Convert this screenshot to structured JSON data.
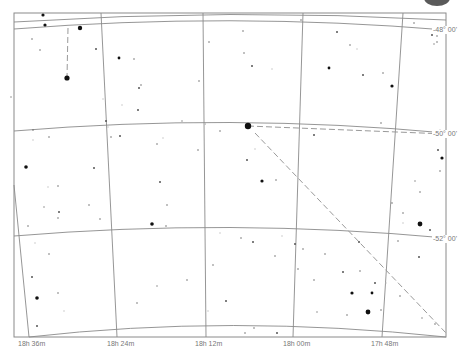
{
  "chart_type": "star-chart",
  "colors": {
    "background": "#ffffff",
    "grid": "#8a8a8a",
    "star": "#111111",
    "faint_star": "#bdbdbd",
    "dashed_line": "#9a9a9a",
    "label": "#777777",
    "corner_blob": "#5a5a5a"
  },
  "dec_labels": [
    {
      "text": "-48° 00'",
      "x": 432,
      "y": 26
    },
    {
      "text": "-50° 00'",
      "x": 432,
      "y": 130
    },
    {
      "text": "-52° 00'",
      "x": 432,
      "y": 235
    }
  ],
  "ra_labels": [
    {
      "text": "18h 36m",
      "x": 18,
      "y": 340
    },
    {
      "text": "18h 24m",
      "x": 107,
      "y": 340
    },
    {
      "text": "18h 12m",
      "x": 195,
      "y": 340
    },
    {
      "text": "18h 00m",
      "x": 283,
      "y": 340
    },
    {
      "text": "17h 48m",
      "x": 371,
      "y": 340
    }
  ],
  "frame": {
    "x1": 14,
    "y1": 13,
    "x2": 446,
    "y2": 337
  },
  "dec_lines": [
    {
      "name": "dec-top",
      "d": "M14,22 Q230,8 446,20"
    },
    {
      "name": "dec-48",
      "d": "M14,29 Q230,12 446,30"
    },
    {
      "name": "dec-50",
      "d": "M14,131 Q230,113 446,133"
    },
    {
      "name": "dec-52",
      "d": "M14,236 Q230,218 446,238"
    },
    {
      "name": "dec-bottom",
      "d": "M29,337 Q230,314 446,337"
    }
  ],
  "ra_lines": [
    {
      "name": "ra-18h36m",
      "x1": 14,
      "y1": 185,
      "x2": 29,
      "y2": 337
    },
    {
      "name": "ra-18h24m",
      "x1": 101,
      "y1": 13,
      "x2": 117,
      "y2": 337
    },
    {
      "name": "ra-18h12m",
      "x1": 203,
      "y1": 13,
      "x2": 206,
      "y2": 337
    },
    {
      "name": "ra-18h00m",
      "x1": 303,
      "y1": 13,
      "x2": 293,
      "y2": 337
    },
    {
      "name": "ra-17h48m",
      "x1": 403,
      "y1": 13,
      "x2": 382,
      "y2": 337
    }
  ],
  "dashed_lines": [
    {
      "name": "constellation-line-1",
      "x1": 68,
      "y1": 28,
      "x2": 67,
      "y2": 78
    },
    {
      "name": "constellation-line-2",
      "x1": 248,
      "y1": 126,
      "x2": 446,
      "y2": 134
    },
    {
      "name": "constellation-line-3",
      "x1": 255,
      "y1": 133,
      "x2": 446,
      "y2": 333
    }
  ],
  "bright_stars": [
    {
      "x": 248,
      "y": 126,
      "r": 3.2
    },
    {
      "x": 67,
      "y": 78,
      "r": 2.6
    },
    {
      "x": 80,
      "y": 28,
      "r": 2.2
    },
    {
      "x": 43,
      "y": 15,
      "r": 1.6
    },
    {
      "x": 45,
      "y": 25,
      "r": 1.6
    },
    {
      "x": 420,
      "y": 224,
      "r": 2.4
    },
    {
      "x": 368,
      "y": 312,
      "r": 2.4
    },
    {
      "x": 152,
      "y": 224,
      "r": 1.8
    },
    {
      "x": 26,
      "y": 167,
      "r": 1.8
    },
    {
      "x": 37,
      "y": 298,
      "r": 1.8
    },
    {
      "x": 352,
      "y": 293,
      "r": 1.6
    },
    {
      "x": 442,
      "y": 158,
      "r": 1.6
    },
    {
      "x": 262,
      "y": 181,
      "r": 1.6
    },
    {
      "x": 119,
      "y": 58,
      "r": 1.4
    },
    {
      "x": 329,
      "y": 68,
      "r": 1.4
    },
    {
      "x": 392,
      "y": 86,
      "r": 1.6
    },
    {
      "x": 372,
      "y": 293,
      "r": 1.4
    }
  ],
  "stars": [
    [
      11,
      97
    ],
    [
      32,
      39
    ],
    [
      40,
      50
    ],
    [
      96,
      49
    ],
    [
      103,
      99
    ],
    [
      134,
      59
    ],
    [
      139,
      88
    ],
    [
      141,
      85
    ],
    [
      122,
      105
    ],
    [
      138,
      110
    ],
    [
      199,
      81
    ],
    [
      209,
      42
    ],
    [
      205,
      124
    ],
    [
      243,
      31
    ],
    [
      244,
      53
    ],
    [
      252,
      66
    ],
    [
      272,
      69
    ],
    [
      301,
      20
    ],
    [
      337,
      32
    ],
    [
      350,
      45
    ],
    [
      357,
      49
    ],
    [
      363,
      75
    ],
    [
      383,
      73
    ],
    [
      414,
      23
    ],
    [
      434,
      44
    ],
    [
      437,
      42
    ],
    [
      437,
      36
    ],
    [
      432,
      35
    ],
    [
      33,
      140
    ],
    [
      49,
      137
    ],
    [
      94,
      168
    ],
    [
      58,
      186
    ],
    [
      48,
      187
    ],
    [
      59,
      212
    ],
    [
      58,
      218
    ],
    [
      89,
      205
    ],
    [
      44,
      207
    ],
    [
      28,
      226
    ],
    [
      33,
      130
    ],
    [
      106,
      121
    ],
    [
      108,
      127
    ],
    [
      111,
      137
    ],
    [
      120,
      136
    ],
    [
      157,
      144
    ],
    [
      163,
      138
    ],
    [
      160,
      182
    ],
    [
      167,
      205
    ],
    [
      166,
      226
    ],
    [
      182,
      121
    ],
    [
      198,
      150
    ],
    [
      220,
      131
    ],
    [
      247,
      160
    ],
    [
      255,
      149
    ],
    [
      276,
      180
    ],
    [
      314,
      135
    ],
    [
      381,
      123
    ],
    [
      440,
      130
    ],
    [
      438,
      150
    ],
    [
      440,
      171
    ],
    [
      420,
      192
    ],
    [
      415,
      181
    ],
    [
      403,
      213
    ],
    [
      392,
      203
    ],
    [
      430,
      230
    ],
    [
      35,
      243
    ],
    [
      49,
      254
    ],
    [
      32,
      277
    ],
    [
      58,
      293
    ],
    [
      64,
      311
    ],
    [
      37,
      326
    ],
    [
      100,
      219
    ],
    [
      137,
      303
    ],
    [
      157,
      286
    ],
    [
      187,
      280
    ],
    [
      213,
      265
    ],
    [
      226,
      301
    ],
    [
      208,
      311
    ],
    [
      241,
      238
    ],
    [
      253,
      242
    ],
    [
      275,
      256
    ],
    [
      282,
      236
    ],
    [
      295,
      244
    ],
    [
      298,
      269
    ],
    [
      314,
      280
    ],
    [
      317,
      312
    ],
    [
      254,
      328
    ],
    [
      245,
      333
    ],
    [
      277,
      333
    ],
    [
      220,
      233
    ],
    [
      325,
      254
    ],
    [
      375,
      283
    ],
    [
      381,
      310
    ],
    [
      386,
      283
    ],
    [
      343,
      272
    ],
    [
      347,
      315
    ],
    [
      360,
      271
    ],
    [
      422,
      318
    ],
    [
      435,
      324
    ],
    [
      400,
      296
    ],
    [
      419,
      257
    ],
    [
      403,
      223
    ],
    [
      398,
      241
    ],
    [
      359,
      242
    ],
    [
      303,
      249
    ]
  ]
}
